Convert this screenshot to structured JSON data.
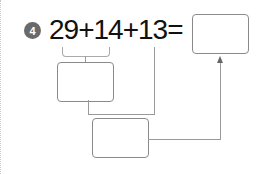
{
  "problem": {
    "number": "4",
    "expression": "29+14+13=",
    "answer_box": "",
    "step1_box": "",
    "step2_box": ""
  }
}
